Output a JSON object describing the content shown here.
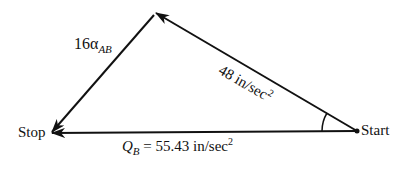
{
  "diagram": {
    "type": "vector-triangle",
    "stroke_color": "#111111",
    "points": {
      "start": {
        "label": "Start",
        "x": 357,
        "y": 131
      },
      "stop": {
        "label": "Stop",
        "x": 50,
        "y": 133
      },
      "apex": {
        "x": 155,
        "y": 13
      }
    },
    "vectors": [
      {
        "id": "q_b",
        "from": "start",
        "to": "stop",
        "label_var": "Q",
        "label_sub": "B",
        "label_rest": " = 55.43 in/sec",
        "label_sup": "2"
      },
      {
        "id": "v48",
        "from": "start",
        "to": "apex",
        "label_main": "48 in/sec",
        "label_sup": "2"
      },
      {
        "id": "alpha",
        "from": "apex",
        "to": "stop",
        "label_main": "16α",
        "label_sub": "AB"
      }
    ],
    "angle_marker": "arc at Start between Q_B and 48 in/sec² vectors"
  }
}
